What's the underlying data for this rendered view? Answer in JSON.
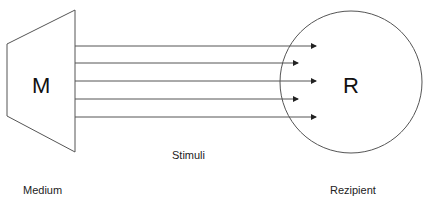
{
  "diagram": {
    "medium": {
      "letter": "M",
      "label": "Medium"
    },
    "recipient": {
      "letter": "R",
      "label": "Rezipient"
    },
    "stimuli_label": "Stimuli",
    "arrows": [
      {
        "y": 46,
        "x2": 316
      },
      {
        "y": 63,
        "x2": 298
      },
      {
        "y": 81,
        "x2": 316
      },
      {
        "y": 99,
        "x2": 298
      },
      {
        "y": 117,
        "x2": 316
      }
    ],
    "colors": {
      "stroke": "#555555",
      "text": "#222222"
    }
  }
}
